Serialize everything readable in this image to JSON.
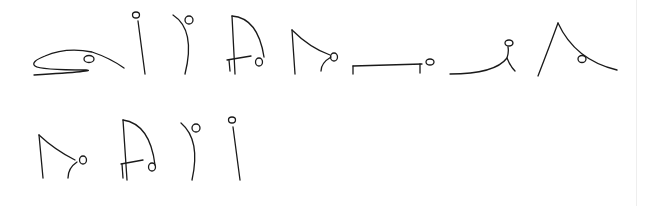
{
  "page": {
    "width": 654,
    "height": 206,
    "background": "#ffffff",
    "ink_color": "#1a1a1a",
    "stroke_width": 1.3,
    "edge_line": {
      "x": 636,
      "color": "#eeeeee"
    }
  },
  "sequence": {
    "rows": 2,
    "figures": [
      {
        "id": "pose-1-cobra",
        "row": 1,
        "paths": [
          "M34,75 Q100,71 86,70 Q40,70 35,66 Q30,62 45,56 Q66,47 92,52 Q110,58 124,68"
        ],
        "head": {
          "cx": 89,
          "cy": 59,
          "rx": 5,
          "ry": 3.5
        }
      },
      {
        "id": "pose-2-standing",
        "row": 1,
        "paths": [
          "M138,21 L145,74"
        ],
        "head": {
          "cx": 136,
          "cy": 15,
          "rx": 3.5,
          "ry": 3
        }
      },
      {
        "id": "pose-3-backbend",
        "row": 1,
        "paths": [
          "M173,15 Q196,30 185,74"
        ],
        "head": {
          "cx": 189,
          "cy": 20,
          "rx": 4,
          "ry": 4
        }
      },
      {
        "id": "pose-4-lunge",
        "row": 1,
        "paths": [
          "M232,16 L235,74",
          "M232,16 Q258,18 264,57",
          "M227,60 L251,56",
          "M229,60 L230,71"
        ],
        "head": {
          "cx": 259,
          "cy": 62,
          "rx": 3.5,
          "ry": 4
        }
      },
      {
        "id": "pose-5-forward-fold",
        "row": 1,
        "paths": [
          "M292,30 L295,74",
          "M292,30 Q310,48 330,55",
          "M331,57 Q321,63 321,71"
        ],
        "head": {
          "cx": 334,
          "cy": 57,
          "rx": 3.5,
          "ry": 4
        }
      },
      {
        "id": "pose-6-plank",
        "row": 1,
        "paths": [
          "M353,66 L422,64",
          "M353,66 L353,74",
          "M420,64 L420,73"
        ],
        "head": {
          "cx": 430,
          "cy": 62,
          "rx": 4,
          "ry": 3
        }
      },
      {
        "id": "pose-7-upward-dog",
        "row": 1,
        "paths": [
          "M450,74 Q495,74 507,58",
          "M508,47 Q509,52 507,58 Q510,66 515,71"
        ],
        "head": {
          "cx": 509,
          "cy": 43,
          "rx": 4,
          "ry": 3
        }
      },
      {
        "id": "pose-8-downward-dog",
        "row": 1,
        "paths": [
          "M538,76 Q550,45 558,23",
          "M558,23 Q575,60 617,70"
        ],
        "head": {
          "cx": 582,
          "cy": 59,
          "rx": 4,
          "ry": 3.5
        }
      },
      {
        "id": "pose-9-forward-fold",
        "row": 2,
        "paths": [
          "M39,135 L43,178",
          "M39,135 Q55,150 75,160",
          "M77,162 Q68,168 68,178"
        ],
        "head": {
          "cx": 83,
          "cy": 160,
          "rx": 3.5,
          "ry": 4
        }
      },
      {
        "id": "pose-10-lunge",
        "row": 2,
        "paths": [
          "M123,120 L127,180",
          "M123,120 Q150,124 155,165",
          "M121,164 L143,160",
          "M122,164 L123,178"
        ],
        "head": {
          "cx": 152,
          "cy": 167,
          "rx": 3.5,
          "ry": 4
        }
      },
      {
        "id": "pose-11-backbend",
        "row": 2,
        "paths": [
          "M181,123 Q201,140 192,180"
        ],
        "head": {
          "cx": 196,
          "cy": 128,
          "rx": 4,
          "ry": 4
        }
      },
      {
        "id": "pose-12-standing",
        "row": 2,
        "paths": [
          "M233,127 L240,180"
        ],
        "head": {
          "cx": 232,
          "cy": 120,
          "rx": 3.5,
          "ry": 3
        }
      }
    ]
  }
}
